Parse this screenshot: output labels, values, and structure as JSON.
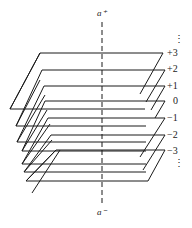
{
  "diagram": {
    "type": "stacked-helical-sheets",
    "axis": {
      "top_label": "a⁺",
      "bottom_label": "a⁻"
    },
    "sheet_labels": [
      "+3",
      "+2",
      "+1",
      "0",
      "−1",
      "−2",
      "−3"
    ],
    "continuation_top": "⋮",
    "continuation_bottom": "⋮",
    "colors": {
      "line": "#1a1a1a",
      "background": "#ffffff"
    }
  }
}
